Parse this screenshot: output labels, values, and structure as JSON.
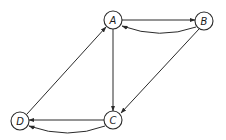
{
  "diagram": {
    "type": "directed-graph",
    "nodes": [
      {
        "id": "A",
        "label": "A",
        "x": 113,
        "y": 20
      },
      {
        "id": "B",
        "label": "B",
        "x": 204,
        "y": 21
      },
      {
        "id": "C",
        "label": "C",
        "x": 113,
        "y": 120
      },
      {
        "id": "D",
        "label": "D",
        "x": 20,
        "y": 121
      }
    ],
    "edges": [
      {
        "from": "A",
        "to": "B",
        "style": "straight"
      },
      {
        "from": "B",
        "to": "A",
        "style": "curved"
      },
      {
        "from": "A",
        "to": "C",
        "style": "straight"
      },
      {
        "from": "B",
        "to": "C",
        "style": "straight"
      },
      {
        "from": "C",
        "to": "D",
        "style": "straight"
      },
      {
        "from": "C",
        "to": "D",
        "style": "curved"
      },
      {
        "from": "D",
        "to": "A",
        "style": "straight"
      }
    ],
    "colors": {
      "stroke": "#2a2a2a",
      "fill": "#ffffff",
      "background": "#ffffff"
    }
  }
}
